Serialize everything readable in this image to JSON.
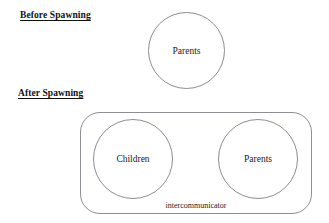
{
  "diagram": {
    "background_color": "#ffffff",
    "stroke_color": "#8d8d93",
    "text_color": "#1a1a1a",
    "sections": [
      {
        "id": "before",
        "heading": "Before Spawning"
      },
      {
        "id": "after",
        "heading": "After Spawning"
      }
    ],
    "shapes": {
      "parents_before": {
        "type": "circle",
        "label": "Parents"
      },
      "intercommunicator": {
        "type": "rounded-rectangle",
        "label": "intercommunicator"
      },
      "children_after": {
        "type": "circle",
        "label": "Children"
      },
      "parents_after": {
        "type": "circle",
        "label": "Parents"
      }
    }
  }
}
